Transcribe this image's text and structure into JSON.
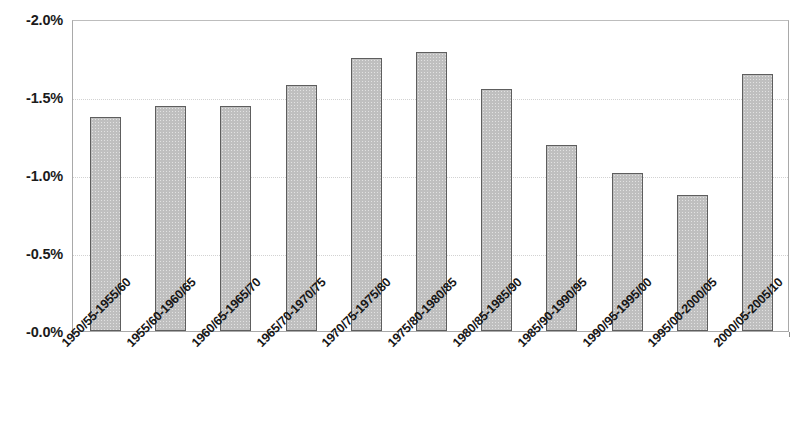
{
  "chart_data": {
    "type": "bar",
    "title": "",
    "subtitle": "",
    "xlabel": "",
    "ylabel": "",
    "categories": [
      "1950/55-1955/60",
      "1955/60-1960/65",
      "1960/65-1965/70",
      "1965/70-1970/75",
      "1970/75-1975/80",
      "1975/80-1980/85",
      "1980/85-1985/90",
      "1985/90-1990/95",
      "1990/95-1995/00",
      "1995/00-2000/05",
      "2000/05-2005/10"
    ],
    "values": [
      -1.37,
      -1.44,
      -1.44,
      -1.58,
      -1.75,
      -1.79,
      -1.55,
      -1.19,
      -1.01,
      -0.87,
      -1.65
    ],
    "ylim": [
      0.0,
      -2.0
    ],
    "y_tick_labels": [
      "-2.0%",
      "-1.5%",
      "-1.0%",
      "-0.5%",
      "-0.0%"
    ],
    "y_tick_values": [
      -2.0,
      -1.5,
      -1.0,
      -0.5,
      -0.0
    ],
    "grid": true,
    "legend": null,
    "legend_position": "none",
    "bar_fill_color": "#bfbfbf",
    "bar_border_color": "#5e5e5e",
    "axis_color": "#a9a9a9",
    "gridline_color": "#d2d2d2",
    "text_color": "#161616",
    "x_tick_rotation": -45
  },
  "layout": {
    "plot_left": 72,
    "plot_top": 20,
    "plot_width": 717,
    "plot_height": 312,
    "bar_width": 31,
    "bar_pitch": 65.2,
    "bar_first_center": 104.5
  }
}
